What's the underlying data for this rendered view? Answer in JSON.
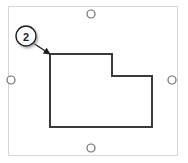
{
  "view": {
    "name": "shape-selection-canvas",
    "width": 188,
    "height": 163,
    "background_color": "#ffffff"
  },
  "frame": {
    "name": "selection-frame",
    "label": "selection bounding frame",
    "x": 8,
    "y": 6,
    "width": 170,
    "height": 150,
    "border_color": "#d7d7d7",
    "fill_color": "#ffffff"
  },
  "handles": {
    "color": "#6e6e6e",
    "fill": "#ffffff",
    "radius": 4,
    "items": [
      {
        "name": "handle-top-center",
        "position": "top-center",
        "cx": 91,
        "cy": 14
      },
      {
        "name": "handle-middle-left",
        "position": "middle-left",
        "cx": 11,
        "cy": 80
      },
      {
        "name": "handle-middle-right",
        "position": "middle-right",
        "cx": 172,
        "cy": 80
      },
      {
        "name": "handle-bottom-center",
        "position": "bottom-center",
        "cx": 91,
        "cy": 148
      }
    ]
  },
  "shape": {
    "name": "l-shaped-polygon",
    "label": "L-shaped profile",
    "points": "50,54 112,54 112,76 152,76 152,127 50,127",
    "stroke_color": "#3a3a3a",
    "stroke_width": 2,
    "fill_color": "#ffffff"
  },
  "callout": {
    "name": "callout-balloon-2",
    "number": "2",
    "circle": {
      "cx": 26,
      "cy": 36,
      "r": 10
    },
    "circle_stroke": "#1d1d1d",
    "circle_fill": "#ffffff",
    "shadow_color": "#b4b4b4",
    "leader": {
      "name": "callout-leader-line",
      "x1": 33,
      "y1": 43,
      "x2": 50,
      "y2": 54,
      "color": "#1d1d1d",
      "arrow_head": "solid-triangle"
    }
  },
  "chart_data": {
    "type": "diagram",
    "title": "",
    "annotations": [
      {
        "label": "2",
        "target": "top-left corner of L-shaped polygon",
        "x": 50,
        "y": 54
      }
    ],
    "vertices": [
      [
        50,
        54
      ],
      [
        112,
        54
      ],
      [
        112,
        76
      ],
      [
        152,
        76
      ],
      [
        152,
        127
      ],
      [
        50,
        127
      ]
    ]
  }
}
